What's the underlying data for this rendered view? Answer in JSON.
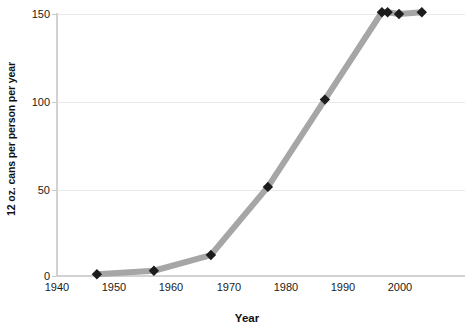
{
  "chart_data": {
    "type": "line",
    "title": "",
    "xlabel": "Year",
    "ylabel": "12 oz. cans per person per year",
    "xlim": [
      1940,
      2010
    ],
    "ylim": [
      0,
      150
    ],
    "grid": true,
    "legend": "none",
    "marker": "black-diamond",
    "line_color": "#a6a6a6",
    "marker_color": "#1c1c1c",
    "x": [
      1947,
      1957,
      1967,
      1977,
      1987,
      1997,
      1998,
      2000,
      2004
    ],
    "values": [
      1,
      3,
      12,
      51,
      101,
      151,
      151,
      150,
      151
    ],
    "series": [
      {
        "name": "12 oz. cans per person per year",
        "points": [
          {
            "x": 1947,
            "y": 1
          },
          {
            "x": 1957,
            "y": 3
          },
          {
            "x": 1967,
            "y": 12
          },
          {
            "x": 1977,
            "y": 51
          },
          {
            "x": 1987,
            "y": 101
          },
          {
            "x": 1997,
            "y": 151
          },
          {
            "x": 1998,
            "y": 151
          },
          {
            "x": 2000,
            "y": 150
          },
          {
            "x": 2004,
            "y": 151
          }
        ]
      }
    ],
    "x_ticks": [
      1940,
      1950,
      1960,
      1970,
      1980,
      1990,
      2000
    ],
    "x_tick_labels": [
      "1940",
      "1950",
      "1960",
      "1970",
      "1980",
      "1990",
      "2000"
    ],
    "y_ticks": [
      0,
      50,
      100,
      150
    ],
    "y_tick_labels": [
      "0",
      "50",
      "100",
      "150"
    ]
  },
  "axes": {
    "x_title": "Year",
    "y_title": "12 oz. cans per person per year"
  },
  "ticks": {
    "y": [
      "150",
      "100",
      "50",
      "0"
    ],
    "x": [
      "1940",
      "1950",
      "1960",
      "1970",
      "1980",
      "1990",
      "2000"
    ]
  },
  "colors": {
    "line": "#a6a6a6",
    "marker": "#1c1c1c",
    "grid": "#e9e9e9",
    "axis": "#d2d2d2",
    "text": "#1a1a1a"
  }
}
